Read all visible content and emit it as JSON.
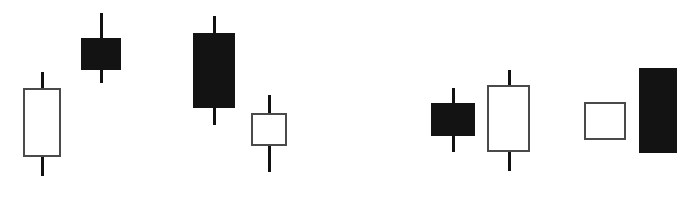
{
  "figure": {
    "width": 686,
    "height": 205,
    "background_color": "#ffffff",
    "bullish_body_color": "#ffffff",
    "bearish_body_color": "#131313",
    "outline_color": "#4a4a4a",
    "wick_color": "#111111"
  },
  "chart_data": {
    "type": "candlestick",
    "title": "",
    "subtitle": "",
    "xlabel": "",
    "ylabel": "",
    "grid": false,
    "legend": "none",
    "axis_visible": false,
    "tick_labels": [],
    "annotations": [],
    "note": "Price axis is inverted in pixel space: smaller y pixel = higher price. Values below are pixel geometry read from the figure.",
    "groups": [
      {
        "name": "left-pattern",
        "candle_indices": [
          0,
          1,
          2,
          3
        ]
      },
      {
        "name": "right-pattern",
        "candle_indices": [
          4,
          5,
          6,
          7
        ]
      }
    ],
    "candles": [
      {
        "index": 1,
        "group": "left-pattern",
        "direction": "bullish",
        "fill": "hollow",
        "body_left": 23,
        "body_top": 88,
        "body_width": 38,
        "body_height": 69,
        "wick_center_x": 42,
        "wick_top": 72,
        "wick_bottom": 176,
        "has_upper_wick": true,
        "has_lower_wick": true
      },
      {
        "index": 2,
        "group": "left-pattern",
        "direction": "bearish",
        "fill": "filled",
        "body_left": 81,
        "body_top": 38,
        "body_width": 40,
        "body_height": 32,
        "wick_center_x": 101,
        "wick_top": 13,
        "wick_bottom": 83,
        "has_upper_wick": true,
        "has_lower_wick": true
      },
      {
        "index": 3,
        "group": "left-pattern",
        "direction": "bearish",
        "fill": "filled",
        "body_left": 193,
        "body_top": 33,
        "body_width": 42,
        "body_height": 75,
        "wick_center_x": 214,
        "wick_top": 16,
        "wick_bottom": 125,
        "has_upper_wick": true,
        "has_lower_wick": true
      },
      {
        "index": 4,
        "group": "left-pattern",
        "direction": "bullish",
        "fill": "hollow",
        "body_left": 251,
        "body_top": 113,
        "body_width": 36,
        "body_height": 33,
        "wick_center_x": 269,
        "wick_top": 95,
        "wick_bottom": 172,
        "has_upper_wick": true,
        "has_lower_wick": true
      },
      {
        "index": 5,
        "group": "right-pattern",
        "direction": "bearish",
        "fill": "filled",
        "body_left": 431,
        "body_top": 103,
        "body_width": 44,
        "body_height": 33,
        "wick_center_x": 453,
        "wick_top": 88,
        "wick_bottom": 152,
        "has_upper_wick": true,
        "has_lower_wick": true
      },
      {
        "index": 6,
        "group": "right-pattern",
        "direction": "bullish",
        "fill": "hollow",
        "body_left": 487,
        "body_top": 85,
        "body_width": 43,
        "body_height": 67,
        "wick_center_x": 509,
        "wick_top": 70,
        "wick_bottom": 171,
        "has_upper_wick": true,
        "has_lower_wick": true
      },
      {
        "index": 7,
        "group": "right-pattern",
        "direction": "bullish",
        "fill": "hollow",
        "body_left": 584,
        "body_top": 102,
        "body_width": 42,
        "body_height": 38,
        "wick_center_x": 605,
        "wick_top": 102,
        "wick_bottom": 140,
        "has_upper_wick": false,
        "has_lower_wick": false
      },
      {
        "index": 8,
        "group": "right-pattern",
        "direction": "bearish",
        "fill": "filled",
        "body_left": 639,
        "body_top": 68,
        "body_width": 38,
        "body_height": 85,
        "wick_center_x": 658,
        "wick_top": 68,
        "wick_bottom": 153,
        "has_upper_wick": false,
        "has_lower_wick": false
      }
    ]
  }
}
